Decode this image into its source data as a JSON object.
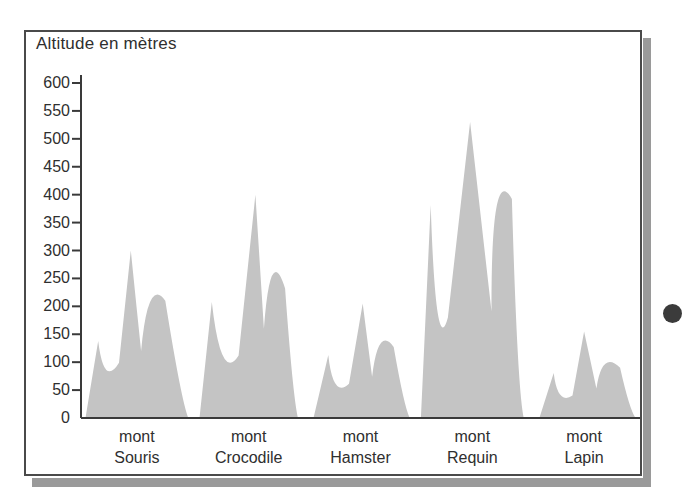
{
  "chart_data": {
    "type": "area",
    "title": "Altitude en mètres",
    "ylabel": "Altitude en mètres",
    "xlabel": "",
    "grid": false,
    "legend": "none",
    "ylim": [
      0,
      620
    ],
    "yticks": [
      0,
      50,
      100,
      150,
      200,
      250,
      300,
      350,
      400,
      450,
      500,
      550,
      600
    ],
    "ytick_labels": [
      "0",
      "50",
      "100",
      "150",
      "200",
      "250",
      "300",
      "350",
      "400",
      "450",
      "500",
      "550",
      "600"
    ],
    "categories": [
      "mont Souris",
      "mont Crocodile",
      "mont Hamster",
      "mont Requin",
      "mont Lapin"
    ],
    "category_lines": [
      [
        "mont",
        "Souris"
      ],
      [
        "mont",
        "Crocodile"
      ],
      [
        "mont",
        "Hamster"
      ],
      [
        "mont",
        "Requin"
      ],
      [
        "mont",
        "Lapin"
      ]
    ],
    "values": [
      300,
      400,
      205,
      530,
      155
    ],
    "series": [
      {
        "name": "Altitude des monts",
        "values": [
          300,
          400,
          205,
          530,
          155
        ]
      }
    ],
    "fill_color": "#c4c4c4",
    "axis_color": "#3a3a3a",
    "text_color": "#2f2f2f",
    "note": "Profil de relief: silhouette continue de cinq sommets"
  },
  "figure": {
    "border_color": "#4a4a4a",
    "shadow_color": "#9a9a9a",
    "background": "#ffffff"
  },
  "marker": {
    "bullet_dot_color": "#3b3b3b",
    "name": "bullet-dot"
  }
}
